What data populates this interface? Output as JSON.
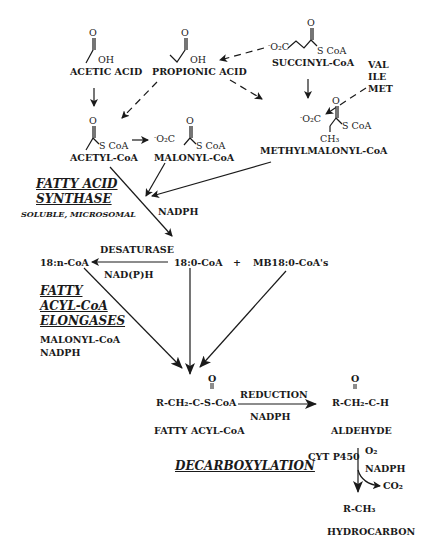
{
  "diagram": {
    "type": "biochemical-pathway",
    "nodes": {
      "acetic_acid": "ACETIC ACID",
      "propionic_acid": "PROPIONIC ACID",
      "succinyl_coa": "SUCCINYL-CoA",
      "val": "VAL",
      "ile": "ILE",
      "met": "MET",
      "acetyl_coa": "ACETYL-CoA",
      "malonyl_coa": "MALONYL-CoA",
      "methylmalonyl_coa": "METHYLMALONYL-CoA",
      "c18_n_coa": "18:n-CoA",
      "c18_0_coa": "18:0-CoA",
      "plus": "+",
      "mb18_0_coas": "MB18:0-CoA's",
      "fatty_acyl_coa_formula": "R-CH₂-C-S-CoA",
      "fatty_acyl_coa": "FATTY ACYL-CoA",
      "aldehyde_formula": "R-CH₂-C-H",
      "aldehyde": "ALDEHYDE",
      "hydrocarbon_formula": "R-CH₃",
      "hydrocarbon": "HYDROCARBON",
      "co2": "CO₂"
    },
    "structure_labels": {
      "oh": "OH",
      "scoa": "S CoA",
      "o2c": "O₂C",
      "o2c_charge": "-",
      "ch3": "CH₃",
      "carbonyl_o": "O"
    },
    "enzymes": {
      "fatty_acid_synthase_line1": "FATTY ACID",
      "fatty_acid_synthase_line2": "SYNTHASE",
      "fas_types": "SOLUBLE, MICROSOMAL",
      "elongases_line1": "FATTY",
      "elongases_line2": "ACYL-CoA",
      "elongases_line3": "ELONGASES",
      "decarboxylation": "DECARBOXYLATION",
      "desaturase": "DESATURASE",
      "reduction": "REDUCTION",
      "cyt_p450": "CYT P450"
    },
    "cofactors": {
      "nadph_fas": "NADPH",
      "nadph_desat": "NAD(P)H",
      "elong_malonyl": "MALONYL-CoA",
      "elong_nadph": "NADPH",
      "nadph_reduction": "NADPH",
      "o2": "O₂",
      "nadph_decarb": "NADPH"
    }
  }
}
